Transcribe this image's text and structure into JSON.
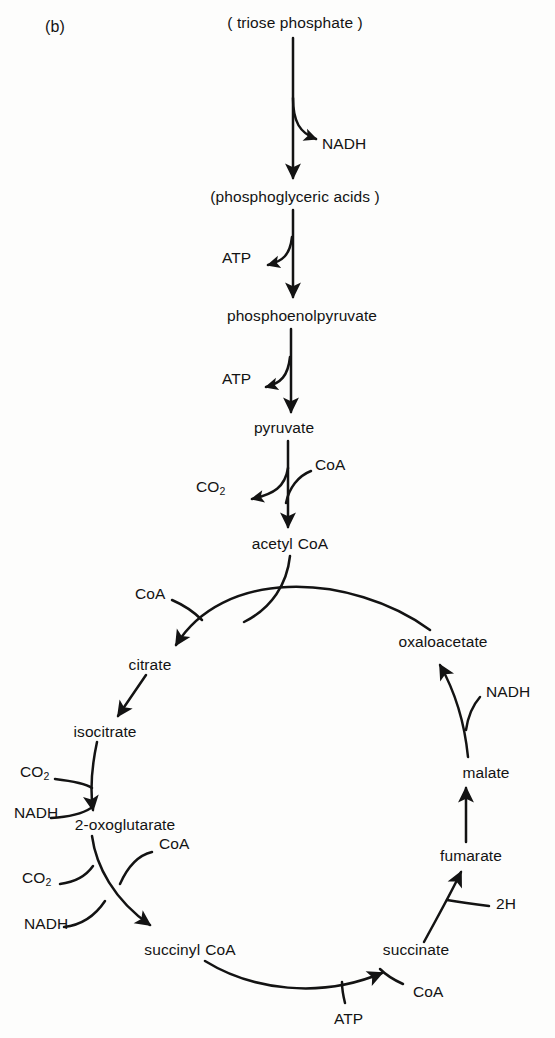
{
  "figure": {
    "panel_label": "(b)",
    "title": "",
    "background_color": "#fdfdfc",
    "ink_color": "#131313"
  },
  "glycolysis": {
    "metabolites": [
      {
        "id": "triose-phosphate",
        "label": "( triose phosphate )",
        "x": 295,
        "y": 22
      },
      {
        "id": "phosphoglyceric-acids",
        "label": "(phosphoglyceric acids )",
        "x": 295,
        "y": 196
      },
      {
        "id": "phosphoenolpyruvate",
        "label": "phosphoenolpyruvate",
        "x": 302,
        "y": 315
      },
      {
        "id": "pyruvate",
        "label": "pyruvate",
        "x": 284,
        "y": 427
      },
      {
        "id": "acetyl-coa",
        "label": "acetyl CoA",
        "x": 286,
        "y": 543
      }
    ],
    "cofactors": [
      {
        "id": "nadh-glycolysis",
        "label": "NADH",
        "x": 322,
        "y": 143,
        "align": "left"
      },
      {
        "id": "atp-pga",
        "label": "ATP",
        "x": 222,
        "y": 257,
        "align": "left"
      },
      {
        "id": "atp-pep",
        "label": "ATP",
        "x": 222,
        "y": 378,
        "align": "left"
      },
      {
        "id": "co2-pyruvate",
        "label": "CO2",
        "x": 196,
        "y": 486,
        "align": "left"
      },
      {
        "id": "coa-pyruvate",
        "label": "CoA",
        "x": 315,
        "y": 464,
        "align": "left"
      }
    ]
  },
  "tca_cycle": {
    "metabolites": [
      {
        "id": "citrate",
        "label": "citrate",
        "x": 150,
        "y": 664
      },
      {
        "id": "isocitrate",
        "label": "isocitrate",
        "x": 105,
        "y": 731
      },
      {
        "id": "2-oxoglutarate",
        "label": "2-oxoglutarate",
        "x": 125,
        "y": 824
      },
      {
        "id": "succinyl-coa",
        "label": "succinyl CoA",
        "x": 186,
        "y": 949
      },
      {
        "id": "succinate",
        "label": "succinate",
        "x": 416,
        "y": 949
      },
      {
        "id": "fumarate",
        "label": "fumarate",
        "x": 471,
        "y": 855
      },
      {
        "id": "malate",
        "label": "malate",
        "x": 486,
        "y": 772
      },
      {
        "id": "oxaloacetate",
        "label": "oxaloacetate",
        "x": 443,
        "y": 641
      }
    ],
    "cofactors": [
      {
        "id": "coa-citrate-synthase",
        "label": "CoA",
        "x": 164,
        "y": 593,
        "align": "right"
      },
      {
        "id": "co2-isocitrate",
        "label": "CO2",
        "x": 20,
        "y": 771,
        "align": "left"
      },
      {
        "id": "nadh-isocitrate",
        "label": "NADH",
        "x": 14,
        "y": 812,
        "align": "left"
      },
      {
        "id": "coa-oxoglutarate",
        "label": "CoA",
        "x": 159,
        "y": 843,
        "align": "left"
      },
      {
        "id": "co2-oxoglutarate",
        "label": "CO2",
        "x": 22,
        "y": 877,
        "align": "left"
      },
      {
        "id": "nadh-oxoglutarate",
        "label": "NADH",
        "x": 24,
        "y": 923,
        "align": "left"
      },
      {
        "id": "atp-succinate",
        "label": "ATP",
        "x": 353,
        "y": 1018,
        "align": "left"
      },
      {
        "id": "coa-succinate",
        "label": "CoA",
        "x": 413,
        "y": 991,
        "align": "left"
      },
      {
        "id": "2h-fumarate",
        "label": "2H",
        "x": 496,
        "y": 903,
        "align": "left"
      },
      {
        "id": "nadh-malate",
        "label": "NADH",
        "x": 486,
        "y": 691,
        "align": "left"
      }
    ]
  }
}
